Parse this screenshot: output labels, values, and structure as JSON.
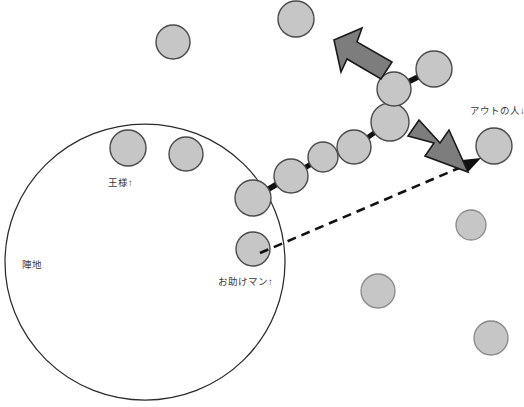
{
  "diagram": {
    "canvas": {
      "width": 524,
      "height": 407,
      "background": "#ffffff"
    },
    "colors": {
      "player_fill": "#c6c6c6",
      "player_stroke": "#4a4a4a",
      "arrow_fill": "#7d7d7d",
      "arrow_stroke": "#1a1a1a",
      "territory_stroke": "#2b2b2b",
      "link_stroke": "#111111",
      "dashed_stroke": "#111111",
      "label_color": "#3a3a3a",
      "caption_color": "#c9c9c9"
    },
    "labels": {
      "territory": "陣地",
      "king": "王様↑",
      "helper": "お助けマン↑",
      "out_person": "アウトの人↓",
      "bottom_caption": ""
    },
    "territory": {
      "name": "陣地",
      "cx": 145,
      "cy": 262,
      "rx": 140,
      "ry": 138
    },
    "chain": {
      "name": "linked-player-chain",
      "count": 7,
      "members": [
        {
          "cx": 253,
          "cy": 198,
          "r": 18,
          "role": "chain-end-in-territory"
        },
        {
          "cx": 291,
          "cy": 176,
          "r": 17,
          "role": "chain-link"
        },
        {
          "cx": 323,
          "cy": 157,
          "r": 15,
          "role": "chain-link"
        },
        {
          "cx": 354,
          "cy": 147,
          "r": 17,
          "role": "chain-link"
        },
        {
          "cx": 390,
          "cy": 122,
          "r": 19,
          "role": "chain-link"
        },
        {
          "cx": 394,
          "cy": 89,
          "r": 17,
          "role": "chain-link"
        },
        {
          "cx": 434,
          "cy": 69,
          "r": 18,
          "role": "chain-end-outside"
        }
      ]
    },
    "free_players": [
      {
        "name": "player-top-left",
        "cx": 173,
        "cy": 42,
        "r": 17
      },
      {
        "name": "player-top-right",
        "cx": 296,
        "cy": 19,
        "r": 18
      },
      {
        "name": "player-king",
        "cx": 128,
        "cy": 148,
        "r": 18,
        "label": "王様↑"
      },
      {
        "name": "player-in-territory-b",
        "cx": 186,
        "cy": 154,
        "r": 17
      },
      {
        "name": "player-helper",
        "cx": 253,
        "cy": 249,
        "r": 17,
        "label": "お助けマン↑"
      },
      {
        "name": "player-out",
        "cx": 494,
        "cy": 146,
        "r": 18,
        "label": "アウトの人↓"
      },
      {
        "name": "player-right-mid",
        "cx": 471,
        "cy": 225,
        "r": 15
      },
      {
        "name": "player-bottom-mid",
        "cx": 378,
        "cy": 291,
        "r": 17
      },
      {
        "name": "player-bottom-right",
        "cx": 491,
        "cy": 338,
        "r": 17
      }
    ],
    "arrows": [
      {
        "name": "arrow-up-left",
        "direction": "up-left",
        "x": 333,
        "y": 28,
        "w": 62,
        "h": 58
      },
      {
        "name": "arrow-down-right",
        "direction": "down-right",
        "x": 404,
        "y": 118,
        "w": 66,
        "h": 62
      }
    ],
    "dashed_arrow": {
      "name": "escape-path-arrow",
      "from": {
        "x": 260,
        "y": 253
      },
      "to": {
        "x": 480,
        "y": 160
      },
      "style": "dashed"
    },
    "label_positions": {
      "territory": {
        "x": 22,
        "y": 268
      },
      "king": {
        "x": 108,
        "y": 186
      },
      "helper": {
        "x": 218,
        "y": 285
      },
      "out_person": {
        "x": 470,
        "y": 114
      }
    }
  }
}
